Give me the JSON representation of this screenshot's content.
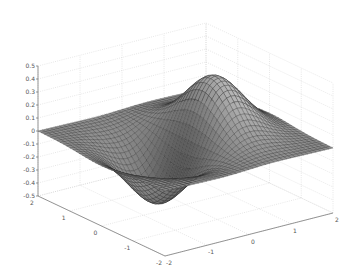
{
  "chart_data": {
    "type": "surface3d",
    "title": "",
    "function": "z = x * exp(-x^2 - y^2)",
    "colormap": "gray",
    "x": {
      "label": "",
      "range": [
        -2,
        2
      ],
      "ticks": [
        -2,
        -1,
        0,
        1,
        2
      ],
      "tick_labels": [
        "-2",
        "-1",
        "0",
        "1",
        "2"
      ]
    },
    "y": {
      "label": "",
      "range": [
        -2,
        2
      ],
      "ticks": [
        -2,
        -1,
        0,
        1,
        2
      ],
      "tick_labels": [
        "-2",
        "-1",
        "0",
        "1",
        "2"
      ]
    },
    "z": {
      "label": "",
      "range": [
        -0.5,
        0.5
      ],
      "ticks": [
        -0.5,
        -0.4,
        -0.3,
        -0.2,
        -0.1,
        0,
        0.1,
        0.2,
        0.3,
        0.4,
        0.5
      ],
      "tick_labels": [
        "-0.5",
        "-0.4",
        "-0.3",
        "-0.2",
        "-0.1",
        "0",
        "0.1",
        "0.2",
        "0.3",
        "0.4",
        "0.5"
      ]
    },
    "grid": true,
    "mesh_resolution": 40,
    "extrema": {
      "max": {
        "x": 0.707,
        "y": 0,
        "z": 0.429
      },
      "min": {
        "x": -0.707,
        "y": 0,
        "z": -0.429
      }
    },
    "legend": null
  },
  "projection": {
    "origin": [
      185.5,
      139.5
    ],
    "ex": [
      42,
      -10.75
    ],
    "ey": [
      -31.75,
      -15
    ],
    "ez": [
      0,
      -130
    ]
  },
  "colors": {
    "background": "#ffffff",
    "grid": "#cfcfcf",
    "axis": "#6a6a6a",
    "mesh_edge": "#2a2a2a",
    "shade_dark": "#1e1e1e",
    "shade_light": "#e6e6e6"
  }
}
